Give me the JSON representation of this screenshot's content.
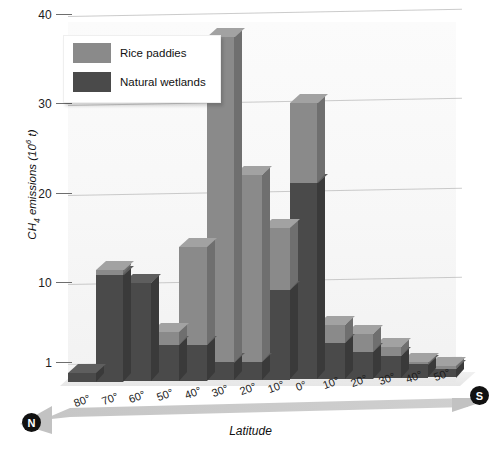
{
  "chart_data": {
    "type": "bar",
    "subtype": "stacked-3d-column",
    "title": "",
    "xlabel": "Latitude",
    "ylabel": "CH4 emissions (10^6 t)",
    "ylabel_parts": {
      "prefix": "CH",
      "sub": "4",
      "mid": " emissions (10",
      "sup": "6",
      "suffix": " t)"
    },
    "categories": [
      "80°",
      "70°",
      "60°",
      "50°",
      "40°",
      "30°",
      "20°",
      "10°",
      "0°",
      "10°",
      "20°",
      "30°",
      "40°",
      "50°"
    ],
    "category_hemispheres": [
      "N",
      "N",
      "N",
      "N",
      "N",
      "N",
      "N",
      "N",
      "",
      "S",
      "S",
      "S",
      "S",
      "S"
    ],
    "series": [
      {
        "name": "Natural wetlands",
        "color": "#4a4a4a",
        "values": [
          1.0,
          12.0,
          11.0,
          4.0,
          4.0,
          2.0,
          2.0,
          10.0,
          22.0,
          4.0,
          3.0,
          2.5,
          1.5,
          1.0
        ]
      },
      {
        "name": "Rice paddies",
        "color": "#8a8a8a",
        "values": [
          0.0,
          0.5,
          0.0,
          1.5,
          11.0,
          36.5,
          21.0,
          7.0,
          9.0,
          2.0,
          2.0,
          1.0,
          0.3,
          0.3
        ]
      }
    ],
    "totals": [
      1.0,
      12.5,
      11.0,
      5.5,
      15.0,
      38.5,
      23.0,
      17.0,
      31.0,
      6.0,
      5.0,
      3.5,
      1.8,
      1.3
    ],
    "ylim": [
      0,
      40
    ],
    "yticks": [
      1,
      10,
      20,
      30,
      40
    ],
    "ytick_labels": [
      "1",
      "10",
      "20",
      "30",
      "40"
    ],
    "grid": true,
    "legend_position": "top-left",
    "axis_direction_left": "N",
    "axis_direction_right": "S"
  },
  "legend": {
    "items": [
      {
        "label": "Rice paddies",
        "color": "#8a8a8a"
      },
      {
        "label": "Natural wetlands",
        "color": "#4a4a4a"
      }
    ]
  },
  "colors": {
    "rice": "#8a8a8a",
    "rice_top": "#a2a2a2",
    "rice_side": "#6f6f6f",
    "wetland": "#4a4a4a",
    "wetland_top": "#5e5e5e",
    "wetland_side": "#3a3a3a",
    "grid": "#b9b9b9",
    "arrow": "#bdbdbd",
    "text": "#1c1c1c"
  },
  "axis": {
    "latitude_label": "Latitude",
    "north_badge": "N",
    "south_badge": "S"
  }
}
